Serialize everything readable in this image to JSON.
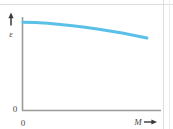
{
  "figure": {
    "background_color": "#ffffff",
    "border_color": "#d8d8d8"
  },
  "axes": {
    "color": "#9a9a9a",
    "y_origin_label": "0",
    "x_origin_label": "0",
    "x_axis_label": "M",
    "y_axis_label": "ε",
    "x_arrow_icon": "right-arrow-icon",
    "y_arrow_icon": "up-arrow-icon"
  },
  "chart_data": {
    "type": "line",
    "title": "",
    "xlabel": "M",
    "ylabel": "ε",
    "xlim": [
      0,
      1
    ],
    "ylim": [
      0,
      1
    ],
    "grid": false,
    "legend": null,
    "xticks": [
      0
    ],
    "xticklabels": [
      "0"
    ],
    "yticks": [
      0
    ],
    "yticklabels": [
      "0"
    ],
    "series": [
      {
        "name": "epsilon vs M",
        "color": "#5bc0e8",
        "linewidth": 3,
        "x": [
          0.0,
          0.1,
          0.2,
          0.3,
          0.4,
          0.5,
          0.6,
          0.7,
          0.8,
          0.9,
          1.0
        ],
        "y": [
          0.945,
          0.94,
          0.932,
          0.921,
          0.907,
          0.891,
          0.872,
          0.851,
          0.828,
          0.803,
          0.776
        ]
      }
    ],
    "annotation": "epsilon decreases gently and slightly convexly as M increases"
  }
}
